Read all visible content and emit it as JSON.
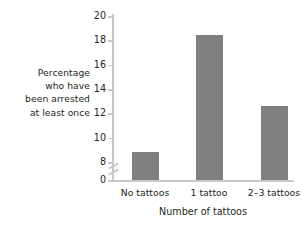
{
  "chart_data": {
    "type": "bar",
    "title": "",
    "subtitle": "",
    "categories": [
      "No tattoos",
      "1 tattoo",
      "2–3 tattoos"
    ],
    "values": [
      8.8,
      18.4,
      12.6
    ],
    "xlabel": "Number of tattoos",
    "ylabel": "Percentage who have been arrested at least once",
    "ylabel_lines": [
      "Percentage",
      "who have",
      "been arrested",
      "at least once"
    ],
    "ylim": [
      0,
      20
    ],
    "y_axis_break": true,
    "y_break_between": [
      0,
      8
    ],
    "yticks": [
      0,
      8,
      10,
      12,
      14,
      16,
      18,
      20
    ],
    "ytick_labels": [
      "0",
      "8",
      "10",
      "12",
      "14",
      "16",
      "18",
      "20"
    ],
    "grid": false,
    "legend": false,
    "legend_position": "none",
    "bar_color": "#808080",
    "axis_color": "#c9c9c9",
    "text_color": "#231f20",
    "background_color": "#ffffff"
  }
}
